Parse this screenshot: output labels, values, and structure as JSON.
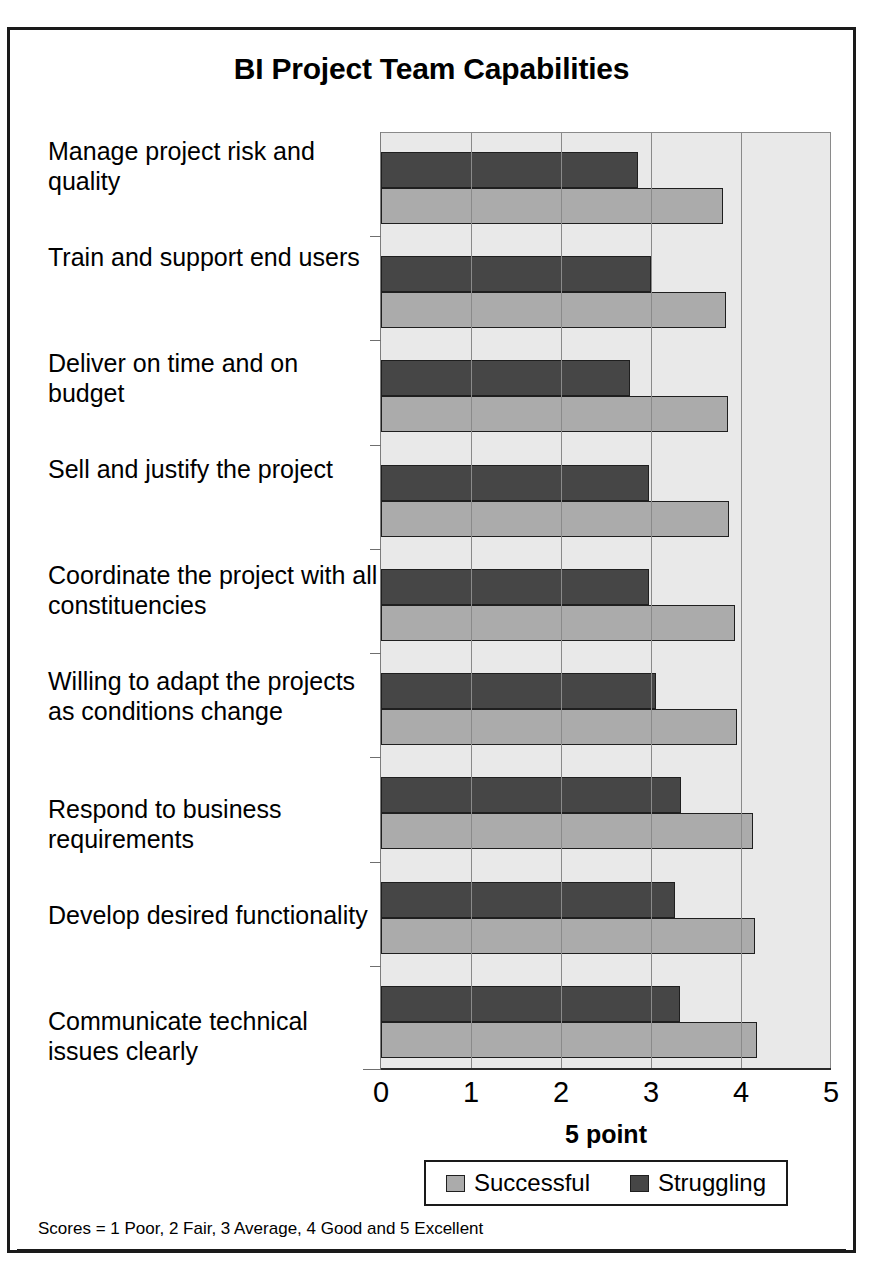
{
  "chart_data": {
    "type": "bar",
    "orientation": "horizontal",
    "title": "BI Project Team Capabilities",
    "xlabel": "5 point",
    "ylabel": "",
    "xlim": [
      0,
      5
    ],
    "xticks": [
      "0",
      "1",
      "2",
      "3",
      "4",
      "5"
    ],
    "grid": true,
    "legend_position": "bottom",
    "categories": [
      "Manage project risk and quality",
      "Train and support end users",
      "Deliver on time and on budget",
      "Sell and justify the project",
      "Coordinate the project with all constituencies",
      "Willing to adapt the projects as conditions change",
      "Respond to business requirements",
      "Develop desired functionality",
      "Communicate technical issues clearly"
    ],
    "series": [
      {
        "name": "Successful",
        "color": "#ababab",
        "values": [
          3.8,
          3.83,
          3.85,
          3.87,
          3.93,
          3.96,
          4.13,
          4.15,
          4.18
        ]
      },
      {
        "name": "Struggling",
        "color": "#464646",
        "values": [
          2.85,
          3.0,
          2.77,
          2.98,
          2.98,
          3.05,
          3.33,
          3.27,
          3.32
        ]
      }
    ],
    "footnote": "Scores = 1 Poor, 2 Fair, 3 Average, 4 Good and 5 Excellent"
  },
  "colors": {
    "successful": "#ababab",
    "struggling": "#464646",
    "plot_background": "#e9e9e9",
    "gridline": "#8a8a8a",
    "border": "#1a1a1a"
  }
}
